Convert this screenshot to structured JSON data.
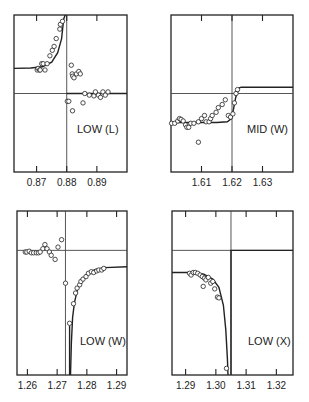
{
  "figure": {
    "background": "#ffffff",
    "ink": "#222222",
    "gridline_color": "#444444"
  },
  "chart_data": [
    {
      "type": "scatter",
      "title": "",
      "label": "LOW (L)",
      "xlabel": "",
      "ylabel": "",
      "xticks": [
        0.87,
        0.88,
        0.89
      ],
      "xtick_labels": [
        "0.87",
        "0.88",
        "0.89"
      ],
      "xlim": [
        0.8625,
        0.9
      ],
      "ylim": [
        -1.0,
        1.0
      ],
      "reference_x": 0.88,
      "reference_y": 0.0,
      "grid": false,
      "frame": {
        "x": 14,
        "y": 15,
        "w": 113,
        "h": 157
      },
      "label_pos": {
        "x": 77,
        "y": 133
      },
      "points": [
        [
          0.8702,
          0.3
        ],
        [
          0.8705,
          0.32
        ],
        [
          0.871,
          0.3
        ],
        [
          0.8712,
          0.3
        ],
        [
          0.8717,
          0.38
        ],
        [
          0.8722,
          0.38
        ],
        [
          0.8728,
          0.3
        ],
        [
          0.8735,
          0.38
        ],
        [
          0.8744,
          0.48
        ],
        [
          0.8752,
          0.55
        ],
        [
          0.8758,
          0.6
        ],
        [
          0.8765,
          0.7
        ],
        [
          0.8777,
          0.82
        ],
        [
          0.8779,
          0.88
        ],
        [
          0.8786,
          0.92
        ],
        [
          0.8815,
          0.36
        ],
        [
          0.8818,
          0.25
        ],
        [
          0.882,
          0.22
        ],
        [
          0.8824,
          0.2
        ],
        [
          0.8832,
          0.25
        ],
        [
          0.884,
          0.28
        ],
        [
          0.8845,
          0.25
        ],
        [
          0.886,
          0.0
        ],
        [
          0.8875,
          -0.02
        ],
        [
          0.889,
          -0.03
        ],
        [
          0.8895,
          0.02
        ],
        [
          0.8905,
          -0.02
        ],
        [
          0.8912,
          -0.05
        ],
        [
          0.892,
          0.02
        ],
        [
          0.8928,
          -0.02
        ],
        [
          0.8937,
          0.02
        ],
        [
          0.8802,
          -0.1
        ],
        [
          0.8807,
          -0.1
        ],
        [
          0.8819,
          -0.22
        ],
        [
          0.8854,
          -0.12
        ]
      ],
      "curves": [
        {
          "name": "fit",
          "points": [
            [
              0.8625,
              0.32
            ],
            [
              0.868,
              0.325
            ],
            [
              0.872,
              0.34
            ],
            [
              0.875,
              0.4
            ],
            [
              0.877,
              0.52
            ],
            [
              0.8783,
              0.7
            ],
            [
              0.879,
              0.95
            ],
            [
              0.8795,
              1.0
            ]
          ]
        },
        {
          "name": "fit-right",
          "points": [
            [
              0.88,
              0.0
            ],
            [
              0.9,
              0.0
            ]
          ]
        }
      ]
    },
    {
      "type": "scatter",
      "title": "",
      "label": "MID (W)",
      "xlabel": "",
      "ylabel": "",
      "xticks": [
        1.61,
        1.62,
        1.63
      ],
      "xtick_labels": [
        "1.61",
        "1.62",
        "1.63"
      ],
      "xlim": [
        1.6,
        1.64
      ],
      "ylim": [
        -1.0,
        1.0
      ],
      "reference_x": 1.62,
      "reference_y": 0.0,
      "grid": false,
      "frame": {
        "x": 171,
        "y": 15,
        "w": 122,
        "h": 157
      },
      "label_pos": {
        "x": 247,
        "y": 133
      },
      "points": [
        [
          1.6002,
          -0.38
        ],
        [
          1.6012,
          -0.38
        ],
        [
          1.6022,
          -0.35
        ],
        [
          1.6028,
          -0.32
        ],
        [
          1.6033,
          -0.33
        ],
        [
          1.604,
          -0.35
        ],
        [
          1.6048,
          -0.4
        ],
        [
          1.6052,
          -0.43
        ],
        [
          1.6058,
          -0.43
        ],
        [
          1.6065,
          -0.38
        ],
        [
          1.6075,
          -0.38
        ],
        [
          1.609,
          -0.36
        ],
        [
          1.61,
          -0.32
        ],
        [
          1.611,
          -0.28
        ],
        [
          1.6115,
          -0.36
        ],
        [
          1.6125,
          -0.36
        ],
        [
          1.613,
          -0.32
        ],
        [
          1.6135,
          -0.28
        ],
        [
          1.6148,
          -0.24
        ],
        [
          1.6155,
          -0.18
        ],
        [
          1.6168,
          -0.14
        ],
        [
          1.6178,
          -0.08
        ],
        [
          1.6188,
          -0.28
        ],
        [
          1.6195,
          -0.3
        ],
        [
          1.6203,
          -0.26
        ],
        [
          1.6208,
          -0.12
        ],
        [
          1.6213,
          0.0
        ],
        [
          1.6218,
          0.05
        ],
        [
          1.609,
          -0.62
        ]
      ],
      "curves": [
        {
          "name": "fit",
          "points": [
            [
              1.6,
              -0.37
            ],
            [
              1.605,
              -0.37
            ],
            [
              1.615,
              -0.37
            ],
            [
              1.6185,
              -0.36
            ],
            [
              1.6198,
              -0.32
            ],
            [
              1.6205,
              -0.2
            ],
            [
              1.6212,
              -0.05
            ],
            [
              1.6223,
              0.07
            ],
            [
              1.623,
              0.08
            ],
            [
              1.64,
              0.08
            ]
          ]
        }
      ]
    },
    {
      "type": "scatter",
      "title": "",
      "label": "LOW (W)",
      "xlabel": "",
      "ylabel": "",
      "xticks": [
        1.26,
        1.27,
        1.28,
        1.29
      ],
      "xtick_labels": [
        "1.26",
        "1.27",
        "1.28",
        "1.29"
      ],
      "xlim": [
        1.2565,
        1.2935
      ],
      "ylim": [
        -1.0,
        1.0
      ],
      "reference_x": 1.2728,
      "reference_y": 0.52,
      "grid": false,
      "frame": {
        "x": 17,
        "y": 211,
        "w": 110,
        "h": 164
      },
      "label_pos": {
        "x": 80,
        "y": 345
      },
      "points": [
        [
          1.2593,
          0.5
        ],
        [
          1.2598,
          0.5
        ],
        [
          1.2606,
          0.51
        ],
        [
          1.2613,
          0.49
        ],
        [
          1.2621,
          0.49
        ],
        [
          1.263,
          0.49
        ],
        [
          1.2637,
          0.49
        ],
        [
          1.2643,
          0.5
        ],
        [
          1.2652,
          0.54
        ],
        [
          1.2659,
          0.59
        ],
        [
          1.2666,
          0.54
        ],
        [
          1.2674,
          0.5
        ],
        [
          1.268,
          0.46
        ],
        [
          1.2693,
          0.41
        ],
        [
          1.2703,
          0.56
        ],
        [
          1.2715,
          0.65
        ],
        [
          1.2728,
          0.12
        ],
        [
          1.2742,
          -0.37
        ],
        [
          1.2755,
          -0.13
        ],
        [
          1.2762,
          0.0
        ],
        [
          1.2767,
          0.06
        ],
        [
          1.2776,
          0.1
        ],
        [
          1.278,
          0.14
        ],
        [
          1.2787,
          0.17
        ],
        [
          1.2797,
          0.2
        ],
        [
          1.2805,
          0.24
        ],
        [
          1.2815,
          0.26
        ],
        [
          1.2823,
          0.25
        ],
        [
          1.2833,
          0.27
        ],
        [
          1.284,
          0.28
        ],
        [
          1.285,
          0.28
        ],
        [
          1.2857,
          0.3
        ]
      ],
      "curves": [
        {
          "name": "fit",
          "points": [
            [
              1.2745,
              -1.0
            ],
            [
              1.2748,
              -0.6
            ],
            [
              1.2752,
              -0.3
            ],
            [
              1.2758,
              -0.12
            ],
            [
              1.2768,
              0.04
            ],
            [
              1.278,
              0.14
            ],
            [
              1.28,
              0.23
            ],
            [
              1.2825,
              0.28
            ],
            [
              1.286,
              0.31
            ],
            [
              1.2935,
              0.32
            ]
          ]
        },
        {
          "name": "wall",
          "points": [
            [
              1.2742,
              -1.0
            ],
            [
              1.2742,
              -0.4
            ]
          ]
        }
      ]
    },
    {
      "type": "scatter",
      "title": "",
      "label": "LOW (X)",
      "xlabel": "",
      "ylabel": "",
      "xticks": [
        1.29,
        1.3,
        1.31,
        1.32
      ],
      "xtick_labels": [
        "1.29",
        "1.30",
        "1.31",
        "1.32"
      ],
      "xlim": [
        1.2855,
        1.3255
      ],
      "ylim": [
        -1.0,
        1.0
      ],
      "reference_x": 1.305,
      "reference_y": 0.52,
      "grid": false,
      "frame": {
        "x": 172,
        "y": 211,
        "w": 121,
        "h": 164
      },
      "label_pos": {
        "x": 248,
        "y": 345
      },
      "points": [
        [
          1.2913,
          0.24
        ],
        [
          1.2918,
          0.22
        ],
        [
          1.2925,
          0.25
        ],
        [
          1.2932,
          0.25
        ],
        [
          1.294,
          0.24
        ],
        [
          1.2948,
          0.22
        ],
        [
          1.2955,
          0.2
        ],
        [
          1.2962,
          0.18
        ],
        [
          1.2967,
          0.16
        ],
        [
          1.2975,
          0.19
        ],
        [
          1.2983,
          0.12
        ],
        [
          1.299,
          0.14
        ],
        [
          1.2996,
          0.05
        ],
        [
          1.3005,
          -0.05
        ],
        [
          1.301,
          -0.06
        ],
        [
          1.2958,
          0.08
        ],
        [
          1.3035,
          -0.92
        ]
      ],
      "curves": [
        {
          "name": "fit",
          "points": [
            [
              1.2855,
              0.25
            ],
            [
              1.292,
              0.25
            ],
            [
              1.296,
              0.23
            ],
            [
              1.299,
              0.17
            ],
            [
              1.301,
              0.07
            ],
            [
              1.3025,
              -0.15
            ],
            [
              1.3033,
              -0.45
            ],
            [
              1.3038,
              -0.8
            ],
            [
              1.304,
              -1.0
            ]
          ]
        },
        {
          "name": "wall",
          "points": [
            [
              1.305,
              -1.0
            ],
            [
              1.305,
              0.52
            ],
            [
              1.3255,
              0.52
            ]
          ]
        }
      ]
    }
  ]
}
